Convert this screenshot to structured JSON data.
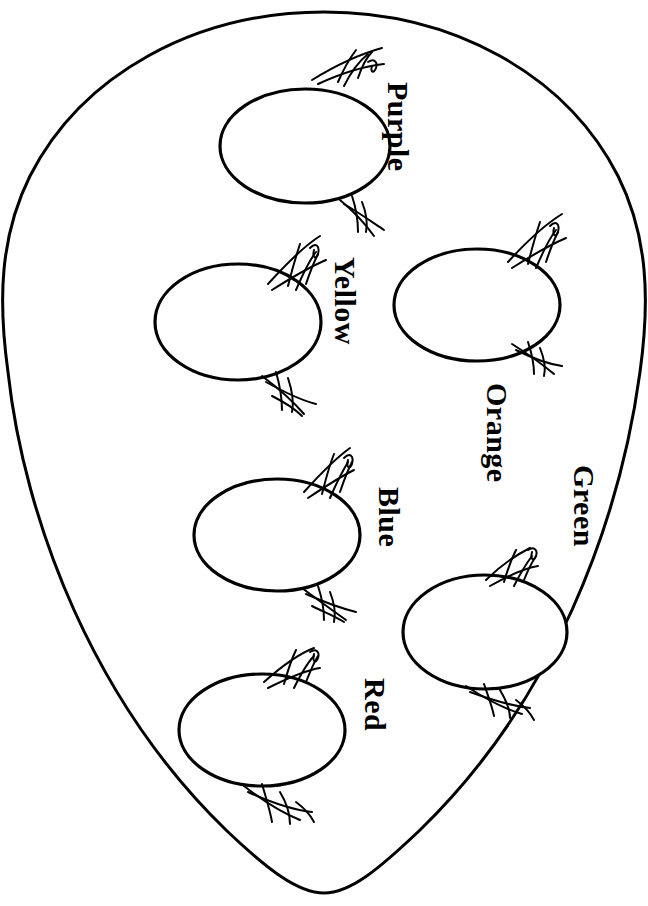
{
  "page": {
    "type": "coloring-page",
    "background_color": "#ffffff",
    "line_color": "#000000",
    "width": 648,
    "height": 906
  },
  "basket": {
    "name": "basket-outline",
    "shape": "large rounded oval",
    "fill": "#ffffff",
    "stroke": "#000000",
    "stroke_width": 3
  },
  "eggs": [
    {
      "id": "egg-purple",
      "label": "Purple",
      "cx": 305,
      "cy": 146,
      "rx": 85,
      "ry": 57,
      "label_x": 415,
      "label_y": 82,
      "label_size": 30
    },
    {
      "id": "egg-yellow",
      "label": "Yellow",
      "cx": 238,
      "cy": 322,
      "rx": 83,
      "ry": 58,
      "label_x": 362,
      "label_y": 257,
      "label_size": 30
    },
    {
      "id": "egg-orange",
      "label": "Orange",
      "cx": 477,
      "cy": 305,
      "rx": 83,
      "ry": 56,
      "label_x": 514,
      "label_y": 383,
      "label_size": 30
    },
    {
      "id": "egg-blue",
      "label": "Blue",
      "cx": 277,
      "cy": 535,
      "rx": 83,
      "ry": 56,
      "label_x": 406,
      "label_y": 487,
      "label_size": 30
    },
    {
      "id": "egg-green",
      "label": "Green",
      "cx": 485,
      "cy": 632,
      "rx": 82,
      "ry": 57,
      "label_x": 601,
      "label_y": 465,
      "label_size": 30
    },
    {
      "id": "egg-red",
      "label": "Red",
      "cx": 262,
      "cy": 730,
      "rx": 83,
      "ry": 56,
      "label_x": 392,
      "label_y": 678,
      "label_size": 30
    }
  ],
  "grass_tufts": {
    "name": "grass-tuft",
    "count": 12,
    "description": "thin hand-drawn blade clusters around each egg"
  }
}
